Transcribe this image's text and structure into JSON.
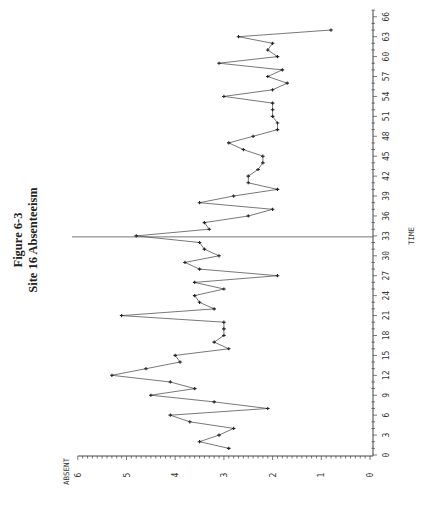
{
  "chart_data": {
    "type": "line",
    "title": "Figure 6-3",
    "subtitle": "Site 16 Absenteeism",
    "xlabel": "TIME",
    "ylabel": "ABSENT",
    "orientation": "rotated 90° counter-clockwise (TIME axis on right edge, ABSENT axis along bottom)",
    "xlim": [
      0,
      66
    ],
    "ylim": [
      0,
      6
    ],
    "x_ticks": [
      0,
      3,
      6,
      9,
      12,
      15,
      18,
      21,
      24,
      27,
      30,
      33,
      36,
      39,
      42,
      45,
      48,
      51,
      54,
      57,
      60,
      63,
      66
    ],
    "y_ticks": [
      0,
      1,
      2,
      3,
      4,
      5,
      6
    ],
    "reference_line": {
      "axis": "x",
      "value": 33
    },
    "grid": false,
    "markers": true,
    "x": [
      1,
      2,
      3,
      4,
      5,
      6,
      7,
      8,
      9,
      10,
      11,
      12,
      13,
      14,
      15,
      16,
      17,
      18,
      19,
      20,
      21,
      22,
      23,
      24,
      25,
      26,
      27,
      28,
      29,
      30,
      31,
      32,
      33,
      34,
      35,
      36,
      37,
      38,
      39,
      40,
      41,
      42,
      43,
      44,
      45,
      46,
      47,
      48,
      49,
      50,
      51,
      52,
      53,
      54,
      55,
      56,
      57,
      58,
      59,
      60,
      61,
      62,
      63,
      64
    ],
    "series": [
      {
        "name": "ABSENT",
        "values": [
          2.9,
          3.5,
          3.1,
          2.8,
          3.7,
          4.1,
          2.1,
          3.2,
          4.5,
          3.6,
          4.1,
          5.3,
          4.6,
          3.9,
          4.0,
          2.9,
          3.2,
          3.0,
          3.0,
          3.0,
          5.1,
          3.2,
          3.5,
          3.6,
          3.0,
          3.6,
          1.9,
          3.5,
          3.8,
          3.1,
          3.4,
          3.5,
          4.8,
          3.3,
          3.4,
          2.5,
          2.0,
          3.5,
          2.8,
          1.9,
          2.5,
          2.5,
          2.3,
          2.2,
          2.2,
          2.6,
          2.9,
          2.4,
          1.9,
          1.9,
          2.0,
          2.0,
          2.0,
          3.0,
          2.0,
          1.7,
          2.1,
          1.8,
          3.1,
          1.9,
          2.1,
          2.0,
          2.7,
          0.8
        ]
      }
    ]
  },
  "colors": {
    "line": "#555555",
    "marker": "#222222",
    "axis": "#444444"
  }
}
